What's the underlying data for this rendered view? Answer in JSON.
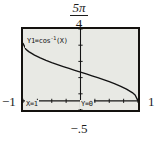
{
  "annotations": {
    "top_fraction_numerator": "5π",
    "top_fraction_denominator": "4",
    "left_label": "−1",
    "right_label": "1",
    "bottom_label": "−.5"
  },
  "screen": {
    "equation_prefix": "Y1=cos",
    "equation_exponent": "-1",
    "equation_suffix": "(X)",
    "trace_x": "X=1",
    "trace_y": "Y=0",
    "background_color": "#e8e9e4",
    "border_color": "#14120f",
    "curve_color": "#141414",
    "axis_color": "#141414"
  },
  "chart_data": {
    "type": "line",
    "title": "",
    "subtitle": "",
    "xlabel": "",
    "ylabel": "",
    "function": "y = cos⁻¹(x)",
    "legend": [
      "Y1=cos-1(X)"
    ],
    "legend_position": "top-left",
    "grid": false,
    "xlim": [
      -1,
      1
    ],
    "ylim": [
      -0.5,
      3.927
    ],
    "y_top_tick_label": "5π/4",
    "x_left_tick_label": "-1",
    "x_right_tick_label": "1",
    "y_bottom_tick_label": "-.5",
    "x_tick_count": 8,
    "y_tick_count": 5,
    "trace_point": {
      "x": 1,
      "y": 0
    },
    "x": [
      -1.0,
      -0.95,
      -0.9,
      -0.8,
      -0.7,
      -0.6,
      -0.5,
      -0.4,
      -0.3,
      -0.2,
      -0.1,
      0.0,
      0.1,
      0.2,
      0.3,
      0.4,
      0.5,
      0.6,
      0.7,
      0.8,
      0.9,
      0.95,
      1.0
    ],
    "values": [
      3.1416,
      2.8242,
      2.6906,
      2.4981,
      2.3462,
      2.2143,
      2.0944,
      1.9823,
      1.8755,
      1.7722,
      1.671,
      1.5708,
      1.4706,
      1.3694,
      1.2661,
      1.1593,
      1.0472,
      0.9273,
      0.7954,
      0.6435,
      0.451,
      0.3176,
      0.0
    ]
  }
}
